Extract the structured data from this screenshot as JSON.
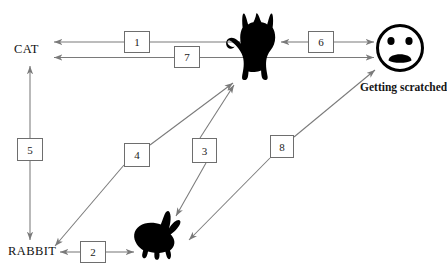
{
  "diagram": {
    "type": "causal-loop-diagram",
    "canvas": {
      "width": 447,
      "height": 278,
      "background": "#ffffff"
    },
    "line_color": "#7a7a7a",
    "box_border_color": "#6e6e6e",
    "silhouette_color": "#000000",
    "nodes": [
      {
        "id": "cat-label",
        "label": "CAT",
        "kind": "text-node",
        "x": 14,
        "y": 43
      },
      {
        "id": "rabbit-label",
        "label": "RABBIT",
        "kind": "text-node",
        "x": 8,
        "y": 245
      },
      {
        "id": "cat-image",
        "label": "cat-silhouette",
        "kind": "icon-node",
        "x": 227,
        "y": 12
      },
      {
        "id": "rabbit-image",
        "label": "rabbit-silhouette",
        "kind": "icon-node",
        "x": 131,
        "y": 210
      },
      {
        "id": "scratched-face",
        "label": "sad-face",
        "kind": "icon-node",
        "x": 377,
        "y": 25
      },
      {
        "id": "scratched-caption",
        "label": "Getting scratched",
        "kind": "text-node",
        "x": 360,
        "y": 82
      }
    ],
    "edges": [
      {
        "id": "edge-1",
        "number": "1",
        "from": "cat-image",
        "to": "cat-label",
        "style": "double-arrow",
        "orientation": "horizontal"
      },
      {
        "id": "edge-2",
        "number": "2",
        "from": "rabbit-image",
        "to": "rabbit-label",
        "style": "double-arrow",
        "orientation": "horizontal"
      },
      {
        "id": "edge-3",
        "number": "3",
        "from": "cat-image",
        "to": "rabbit-image",
        "style": "double-arrow",
        "orientation": "diagonal"
      },
      {
        "id": "edge-4",
        "number": "4",
        "from": "rabbit-label",
        "to": "cat-image",
        "style": "single-arrow",
        "orientation": "diagonal"
      },
      {
        "id": "edge-5",
        "number": "5",
        "from": "cat-label",
        "to": "rabbit-label",
        "style": "double-arrow",
        "orientation": "vertical"
      },
      {
        "id": "edge-6",
        "number": "6",
        "from": "cat-image",
        "to": "scratched-face",
        "style": "double-arrow",
        "orientation": "horizontal"
      },
      {
        "id": "edge-7",
        "number": "7",
        "from": "cat-label",
        "to": "scratched-face",
        "style": "double-arrow",
        "orientation": "horizontal"
      },
      {
        "id": "edge-8",
        "number": "8",
        "from": "rabbit-image",
        "to": "scratched-face",
        "style": "double-arrow",
        "orientation": "diagonal"
      }
    ],
    "boxes": [
      {
        "id": "box-1",
        "number": "1",
        "x": 124,
        "y": 31,
        "w": 26,
        "h": 22
      },
      {
        "id": "box-7",
        "number": "7",
        "x": 174,
        "y": 46,
        "w": 26,
        "h": 22
      },
      {
        "id": "box-6",
        "number": "6",
        "x": 308,
        "y": 31,
        "w": 26,
        "h": 22
      },
      {
        "id": "box-5",
        "number": "5",
        "x": 17,
        "y": 138,
        "w": 26,
        "h": 23
      },
      {
        "id": "box-4",
        "number": "4",
        "x": 124,
        "y": 143,
        "w": 26,
        "h": 24
      },
      {
        "id": "box-3",
        "number": "3",
        "x": 192,
        "y": 138,
        "w": 25,
        "h": 25
      },
      {
        "id": "box-8",
        "number": "8",
        "x": 270,
        "y": 135,
        "w": 24,
        "h": 23
      },
      {
        "id": "box-2",
        "number": "2",
        "x": 80,
        "y": 241,
        "w": 26,
        "h": 22
      }
    ]
  }
}
